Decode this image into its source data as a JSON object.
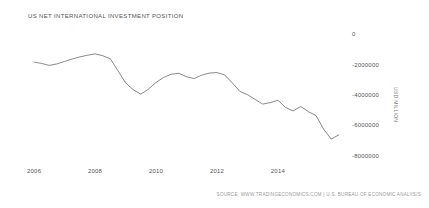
{
  "chart": {
    "title": "US NET INTERNATIONAL INVESTMENT POSITION",
    "source": "SOURCE: WWW.TRADINGECONOMICS.COM | U.S. BUREAU OF ECONOMIC ANALYSIS",
    "y_axis_title": "USD MILLION",
    "line_color": "#6b6b6b",
    "text_color": "#555555"
  },
  "chart_data": {
    "type": "line",
    "title": "US NET INTERNATIONAL INVESTMENT POSITION",
    "xlabel": "",
    "ylabel": "USD Million",
    "grid": false,
    "legend": false,
    "ylim": [
      -8800000,
      400000
    ],
    "xlim": [
      2005.8,
      2016.3
    ],
    "y_ticks": [
      0,
      -2000000,
      -4000000,
      -6000000,
      -8000000
    ],
    "y_tick_labels": [
      "0",
      "-2000000",
      "-4000000",
      "-6000000",
      "-8000000"
    ],
    "x_ticks": [
      2006,
      2008,
      2010,
      2012,
      2014
    ],
    "x_tick_labels": [
      "2006",
      "2008",
      "2010",
      "2012",
      "2014"
    ],
    "series": [
      {
        "name": "US Net International Investment Position",
        "x": [
          2006.0,
          2006.25,
          2006.5,
          2006.75,
          2007.0,
          2007.25,
          2007.5,
          2007.75,
          2008.0,
          2008.25,
          2008.5,
          2008.75,
          2009.0,
          2009.25,
          2009.5,
          2009.75,
          2010.0,
          2010.25,
          2010.5,
          2010.75,
          2011.0,
          2011.25,
          2011.5,
          2011.75,
          2012.0,
          2012.25,
          2012.5,
          2012.75,
          2013.0,
          2013.25,
          2013.5,
          2013.75,
          2014.0,
          2014.25,
          2014.5,
          2014.75,
          2015.0,
          2015.25,
          2015.5,
          2015.75,
          2016.0
        ],
        "values": [
          -1840000,
          -1930000,
          -2060000,
          -1960000,
          -1800000,
          -1640000,
          -1500000,
          -1390000,
          -1300000,
          -1420000,
          -1620000,
          -2400000,
          -3200000,
          -3650000,
          -3950000,
          -3620000,
          -3180000,
          -2850000,
          -2640000,
          -2580000,
          -2800000,
          -2920000,
          -2700000,
          -2560000,
          -2530000,
          -2680000,
          -3200000,
          -3760000,
          -3980000,
          -4290000,
          -4600000,
          -4500000,
          -4350000,
          -4820000,
          -5050000,
          -4760000,
          -5100000,
          -5350000,
          -6250000,
          -6900000,
          -6620000
        ]
      }
    ]
  }
}
